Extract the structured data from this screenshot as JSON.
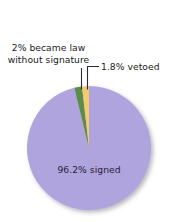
{
  "chart_data": {
    "type": "pie",
    "title": "",
    "categories": [
      "signed",
      "became law without signature",
      "vetoed"
    ],
    "values": [
      96.2,
      2.0,
      1.8
    ],
    "unit": "%",
    "colors": [
      "#b0a4de",
      "#5d8b4b",
      "#f2cd6d"
    ],
    "labels": [
      {
        "key": "signed",
        "text": "96.2% signed",
        "value": 96.2,
        "placement": "inside"
      },
      {
        "key": "became_law",
        "line1": "2% became law",
        "line2": "without signature",
        "value": 2.0,
        "placement": "outside-left",
        "leader": "vertical"
      },
      {
        "key": "vetoed",
        "text": "1.8% vetoed",
        "value": 1.8,
        "placement": "outside-right",
        "leader": "elbow"
      }
    ],
    "legend": "none",
    "grid": false,
    "start_angle_deg": 0,
    "direction": "clockwise",
    "background": "#ffffff"
  },
  "geometry": {
    "center_x": 89,
    "center_y": 148,
    "radius": 62
  },
  "icons": {
    "leader_line_green": "leader-line-icon",
    "leader_line_yellow": "leader-line-icon"
  }
}
